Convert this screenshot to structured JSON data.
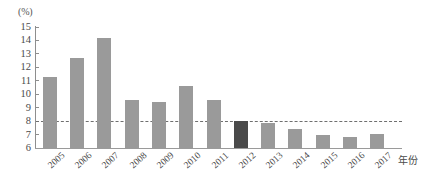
{
  "chart_data": {
    "type": "bar",
    "title": "",
    "subtitle": "",
    "xlabel": "年份",
    "ylabel": "(%)",
    "categories": [
      "2005",
      "2006",
      "2007",
      "2008",
      "2009",
      "2010",
      "2011",
      "2012",
      "2013",
      "2014",
      "2015",
      "2016",
      "2017"
    ],
    "values": [
      11.3,
      12.7,
      14.2,
      9.6,
      9.4,
      10.6,
      9.6,
      8.0,
      7.85,
      7.4,
      7.0,
      6.8,
      7.05
    ],
    "ylim": [
      6,
      15
    ],
    "yticks": [
      15,
      14,
      13,
      12,
      11,
      10,
      9,
      8,
      7,
      6
    ],
    "ytick_labels": [
      "15",
      "14",
      "13",
      "12",
      "11",
      "10",
      "9",
      "8",
      "7",
      "6"
    ],
    "grid": false,
    "legend": "none",
    "highlight_category": "2012",
    "annotations": [
      {
        "type": "hline",
        "value": 8,
        "style": "dashed",
        "label": ""
      }
    ],
    "colors": {
      "bar": "#9a9a9a",
      "bar_highlight": "#4a4a4a",
      "axis": "#8e8e8e",
      "threshold": "#6f6f6f",
      "text": "#4a4a4a"
    }
  }
}
